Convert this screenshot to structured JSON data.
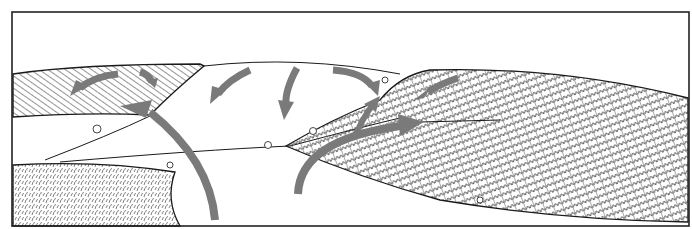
{
  "figure": {
    "frame": {
      "x": 12,
      "y": 12,
      "width": 677,
      "height": 214,
      "stroke": "#222222"
    },
    "colors": {
      "background": "#ffffff",
      "ink": "#1a1a1a",
      "arrow": "#7a7a7a",
      "hatch": "#3a3a3a"
    },
    "regions": [
      {
        "name": "upper-left-field",
        "texture": "diagonal-hatch"
      },
      {
        "name": "lower-left-field",
        "texture": "stipple-grass"
      },
      {
        "name": "central-bare-hill",
        "texture": "none"
      },
      {
        "name": "right-field",
        "texture": "row-crops"
      }
    ],
    "arrows": [
      {
        "name": "arrow-upper-left-field-circulation-a",
        "direction": "curving left"
      },
      {
        "name": "arrow-upper-left-field-circulation-b",
        "direction": "curving down-right"
      },
      {
        "name": "arrow-updraft-left",
        "direction": "rising up-left from bottom"
      },
      {
        "name": "arrow-hilltop-left",
        "direction": "curving down-left"
      },
      {
        "name": "arrow-hilltop-center",
        "direction": "curving down"
      },
      {
        "name": "arrow-hilltop-right",
        "direction": "curving down-right"
      },
      {
        "name": "arrow-right-field-circulation",
        "direction": "curving down-left"
      },
      {
        "name": "arrow-updraft-right",
        "direction": "rising right from bottom"
      },
      {
        "name": "arrow-right-branch-up",
        "direction": "up-right"
      }
    ]
  }
}
